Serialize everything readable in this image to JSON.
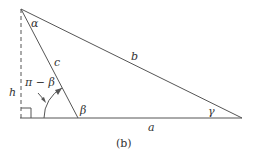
{
  "diagram": {
    "caption": "(b)",
    "sides": {
      "a": "a",
      "b": "b",
      "c": "c",
      "h": "h"
    },
    "angles": {
      "alpha": "α",
      "beta": "β",
      "gamma": "γ",
      "exterior": "π − β"
    },
    "colors": {
      "stroke": "#555555",
      "text": "#333333"
    }
  }
}
